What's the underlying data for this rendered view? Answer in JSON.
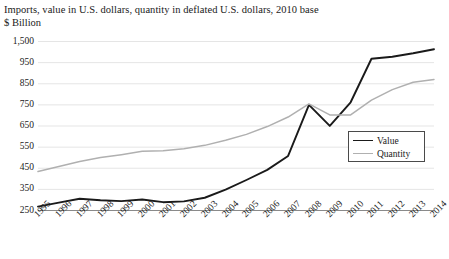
{
  "chart_data": {
    "type": "line",
    "title": "Imports, value in U.S. dollars, quantity in deflated U.S. dollars, 2010 base",
    "ylabel": "$ Billion",
    "xlabel": "",
    "grid": true,
    "legend_position": "inside-right",
    "y_tick_labels": [
      "1,500",
      "950",
      "850",
      "750",
      "650",
      "550",
      "450",
      "350",
      "250"
    ],
    "y_tick_values": [
      1500,
      950,
      850,
      750,
      650,
      550,
      450,
      350,
      250
    ],
    "y_axis_note": "broken axis: top tick 1,500 sits one even step above 950",
    "categories": [
      "1995",
      "1996",
      "1997",
      "1998",
      "1999",
      "2000",
      "2001",
      "2002",
      "2003",
      "2004",
      "2005",
      "2006",
      "2007",
      "2008",
      "2009",
      "2010",
      "2011",
      "2012",
      "2013",
      "2014"
    ],
    "series": [
      {
        "name": "Value",
        "color": "#1a1a1a",
        "width": 1.9,
        "values": [
          266,
          285,
          303,
          296,
          292,
          300,
          287,
          291,
          308,
          346,
          392,
          440,
          506,
          748,
          648,
          760,
          1038,
          1090,
          1180,
          1285
        ]
      },
      {
        "name": "Quantity",
        "color": "#b0b0b0",
        "width": 1.5,
        "values": [
          432,
          456,
          480,
          498,
          512,
          528,
          530,
          540,
          556,
          580,
          608,
          645,
          690,
          752,
          700,
          700,
          770,
          820,
          855,
          868
        ]
      }
    ]
  },
  "legend": {
    "items": [
      {
        "label": "Value"
      },
      {
        "label": "Quantity"
      }
    ]
  },
  "colors": {
    "value_line": "#1a1a1a",
    "quantity_line": "#b0b0b0",
    "grid": "#e2e2e2",
    "axis": "#8a8a8a",
    "legend_border": "#4a4a4a",
    "text": "#1a1a1a",
    "background": "#ffffff"
  }
}
